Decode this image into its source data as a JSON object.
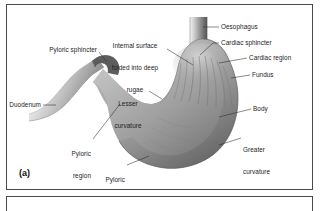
{
  "figure": {
    "panel_letter": "(a)",
    "style": "grayscale-medical-illustration",
    "background_color": "#ffffff",
    "frame_color": "#4a4a4a",
    "ink_color": "#1d1d1d"
  },
  "labels": {
    "oesophagus": "Oesophagus",
    "cardiac_sphincter": "Cardiac sphincter",
    "cardiac_region": "Cardiac region",
    "fundus": "Fundus",
    "body": "Body",
    "greater_curvature_line1": "Greater",
    "greater_curvature_line2": "curvature",
    "lesser_curvature_line1": "Lesser",
    "lesser_curvature_line2": "curvature",
    "internal_surface_line1": "Internal surface",
    "internal_surface_line2": "folded into deep",
    "internal_surface_line3": "rugae",
    "pyloric_sphincter": "Pyloric sphincter",
    "duodenum": "Duodenum",
    "pyloric_region_line1": "Pyloric",
    "pyloric_region_line2": "region",
    "pyloric_antrum_line1": "Pyloric",
    "pyloric_antrum_line2": "antrum"
  },
  "anatomy_parts": [
    {
      "name": "oesophagus",
      "position": "top-center",
      "label": "Oesophagus"
    },
    {
      "name": "cardiac-sphincter",
      "position": "upper-center",
      "label": "Cardiac sphincter"
    },
    {
      "name": "cardiac-region",
      "position": "upper-right",
      "label": "Cardiac region"
    },
    {
      "name": "fundus",
      "position": "right-upper",
      "label": "Fundus"
    },
    {
      "name": "body",
      "position": "right-middle",
      "label": "Body"
    },
    {
      "name": "greater-curvature",
      "position": "right-lower",
      "label": "Greater curvature"
    },
    {
      "name": "lesser-curvature",
      "position": "center-left",
      "label": "Lesser curvature"
    },
    {
      "name": "rugae",
      "position": "center",
      "label": "Internal surface folded into deep rugae"
    },
    {
      "name": "pyloric-sphincter",
      "position": "left-upper",
      "label": "Pyloric sphincter"
    },
    {
      "name": "duodenum",
      "position": "far-left",
      "label": "Duodenum"
    },
    {
      "name": "pyloric-region",
      "position": "lower-left",
      "label": "Pyloric region"
    },
    {
      "name": "pyloric-antrum",
      "position": "bottom-left-center",
      "label": "Pyloric antrum"
    }
  ]
}
